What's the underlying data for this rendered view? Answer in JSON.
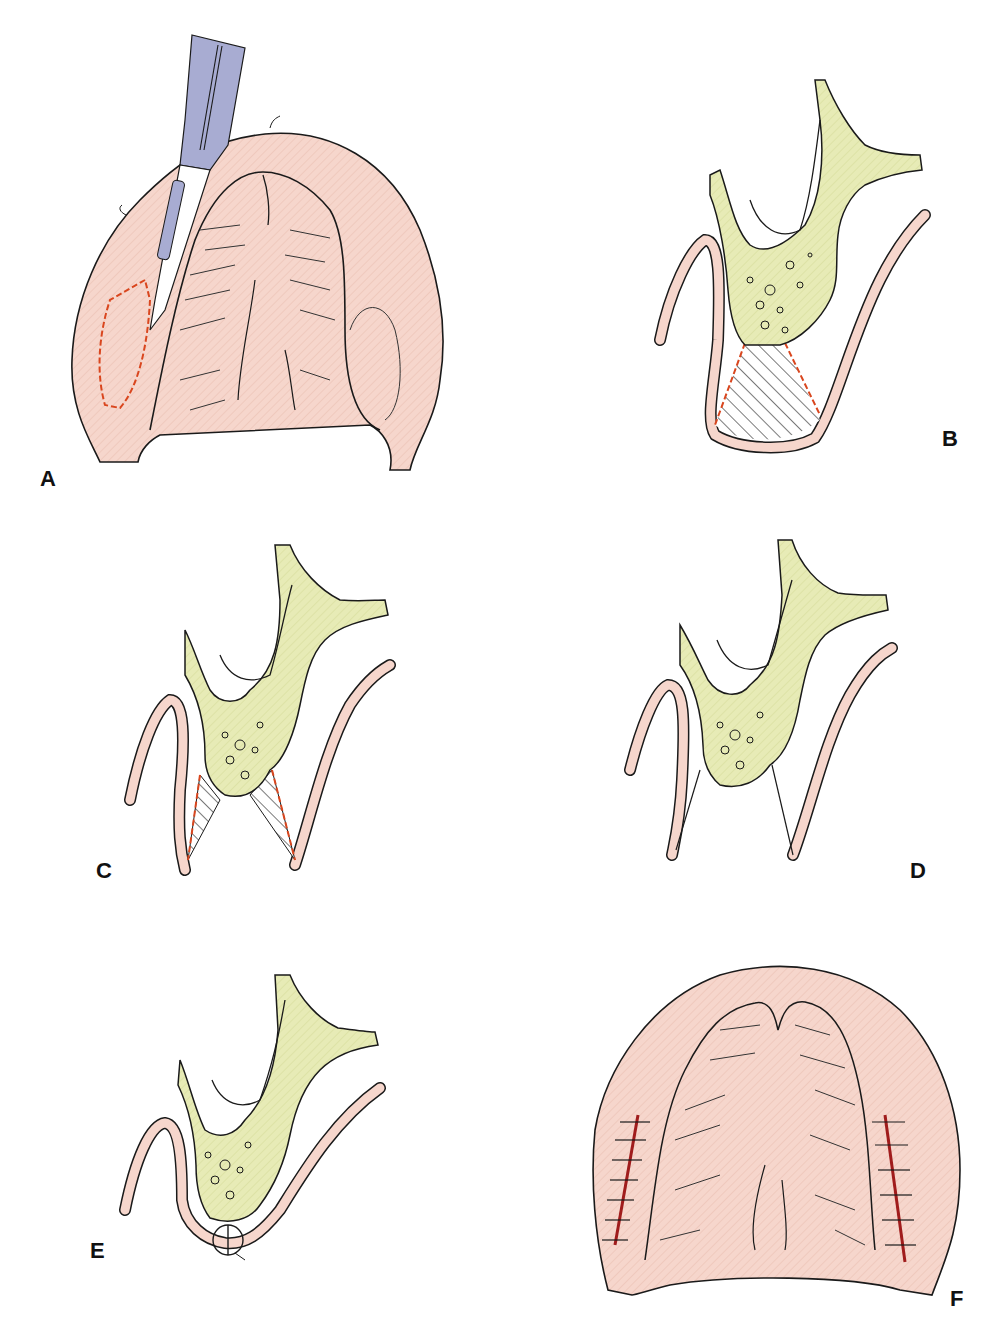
{
  "figure": {
    "colors": {
      "mucosa": "#f6d6cc",
      "bone": "#e7ebb6",
      "outline": "#1a1a1a",
      "incision": "#d9461e",
      "scalpel": "#a8acd2",
      "suture_line": "#a01c1c"
    },
    "panels": [
      {
        "id": "A",
        "label": "A",
        "content": "Palate top view with scalpel making elliptical incision (red dashed outline)"
      },
      {
        "id": "B",
        "label": "B",
        "content": "Cross-section: bone with hatched wedge of tissue to be excised, bounded by red dashed lines"
      },
      {
        "id": "C",
        "label": "C",
        "content": "Cross-section: two hatched triangular wedges marked by red dashed lines"
      },
      {
        "id": "D",
        "label": "D",
        "content": "Cross-section after wedge removal showing exposed V-shaped gap"
      },
      {
        "id": "E",
        "label": "E",
        "content": "Cross-section with mucosal flaps approximated and sutured"
      },
      {
        "id": "F",
        "label": "F",
        "content": "Palate top view with bilateral sutured incisions"
      }
    ]
  }
}
